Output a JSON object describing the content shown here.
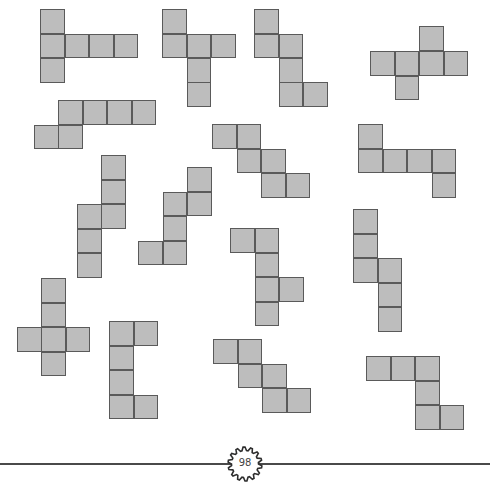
{
  "page": {
    "page_number": "98",
    "square_size": 24.5,
    "square_fill": "#bdbdbd",
    "square_border": "#5a5a5a"
  },
  "nets": [
    {
      "id": "net-1",
      "squares": [
        [
          40,
          9
        ],
        [
          40,
          33.5
        ],
        [
          64.5,
          33.5
        ],
        [
          89,
          33.5
        ],
        [
          113.5,
          33.5
        ],
        [
          40,
          58
        ]
      ]
    },
    {
      "id": "net-2",
      "squares": [
        [
          162,
          9
        ],
        [
          162,
          33.5
        ],
        [
          186.5,
          33.5
        ],
        [
          211,
          33.5
        ],
        [
          186.5,
          58
        ],
        [
          186.5,
          82
        ]
      ]
    },
    {
      "id": "net-3",
      "squares": [
        [
          254,
          9
        ],
        [
          254,
          33.5
        ],
        [
          278.5,
          33.5
        ],
        [
          278.5,
          58
        ],
        [
          278.5,
          82
        ],
        [
          303,
          82
        ]
      ]
    },
    {
      "id": "net-4",
      "squares": [
        [
          419,
          26
        ],
        [
          370,
          51
        ],
        [
          394.5,
          51
        ],
        [
          419,
          51
        ],
        [
          443.5,
          51
        ],
        [
          394.5,
          75.5
        ]
      ]
    },
    {
      "id": "net-5",
      "squares": [
        [
          58,
          100
        ],
        [
          82.5,
          100
        ],
        [
          107,
          100
        ],
        [
          131.5,
          100
        ],
        [
          34,
          124.5
        ],
        [
          58,
          124.5
        ]
      ]
    },
    {
      "id": "net-6",
      "squares": [
        [
          212,
          124
        ],
        [
          236.5,
          124
        ],
        [
          236.5,
          148.5
        ],
        [
          261,
          148.5
        ],
        [
          261,
          173
        ],
        [
          285.5,
          173
        ]
      ]
    },
    {
      "id": "net-7",
      "squares": [
        [
          358,
          124
        ],
        [
          358,
          148.5
        ],
        [
          382.5,
          148.5
        ],
        [
          407,
          148.5
        ],
        [
          431.5,
          148.5
        ],
        [
          431.5,
          173
        ]
      ]
    },
    {
      "id": "net-8",
      "squares": [
        [
          101,
          155
        ],
        [
          101,
          179.5
        ],
        [
          77,
          204
        ],
        [
          101,
          204
        ],
        [
          77,
          228.5
        ],
        [
          77,
          253
        ]
      ]
    },
    {
      "id": "net-9",
      "squares": [
        [
          187,
          167
        ],
        [
          162.5,
          191.5
        ],
        [
          187,
          191.5
        ],
        [
          162.5,
          216
        ],
        [
          138,
          240.5
        ],
        [
          162.5,
          240.5
        ]
      ]
    },
    {
      "id": "net-10",
      "squares": [
        [
          230,
          228
        ],
        [
          254.5,
          228
        ],
        [
          254.5,
          252.5
        ],
        [
          254.5,
          277
        ],
        [
          279,
          277
        ],
        [
          254.5,
          301.5
        ]
      ]
    },
    {
      "id": "net-11",
      "squares": [
        [
          353,
          209
        ],
        [
          353,
          233.5
        ],
        [
          353,
          258
        ],
        [
          377.5,
          258
        ],
        [
          377.5,
          282.5
        ],
        [
          377.5,
          307
        ]
      ]
    },
    {
      "id": "net-12",
      "squares": [
        [
          41,
          278
        ],
        [
          41,
          302.5
        ],
        [
          17,
          327
        ],
        [
          41,
          327
        ],
        [
          65.5,
          327
        ],
        [
          41,
          351.5
        ]
      ]
    },
    {
      "id": "net-13",
      "squares": [
        [
          109,
          321
        ],
        [
          133.5,
          321
        ],
        [
          109,
          345.5
        ],
        [
          109,
          370
        ],
        [
          109,
          394.5
        ],
        [
          133.5,
          394.5
        ]
      ]
    },
    {
      "id": "net-14",
      "squares": [
        [
          213,
          339
        ],
        [
          237.5,
          339
        ],
        [
          237.5,
          363.5
        ],
        [
          262,
          363.5
        ],
        [
          262,
          388
        ],
        [
          286.5,
          388
        ]
      ]
    },
    {
      "id": "net-15",
      "squares": [
        [
          366,
          356
        ],
        [
          390.5,
          356
        ],
        [
          415,
          356
        ],
        [
          415,
          380.5
        ],
        [
          415,
          405
        ],
        [
          439.5,
          405
        ]
      ]
    }
  ]
}
